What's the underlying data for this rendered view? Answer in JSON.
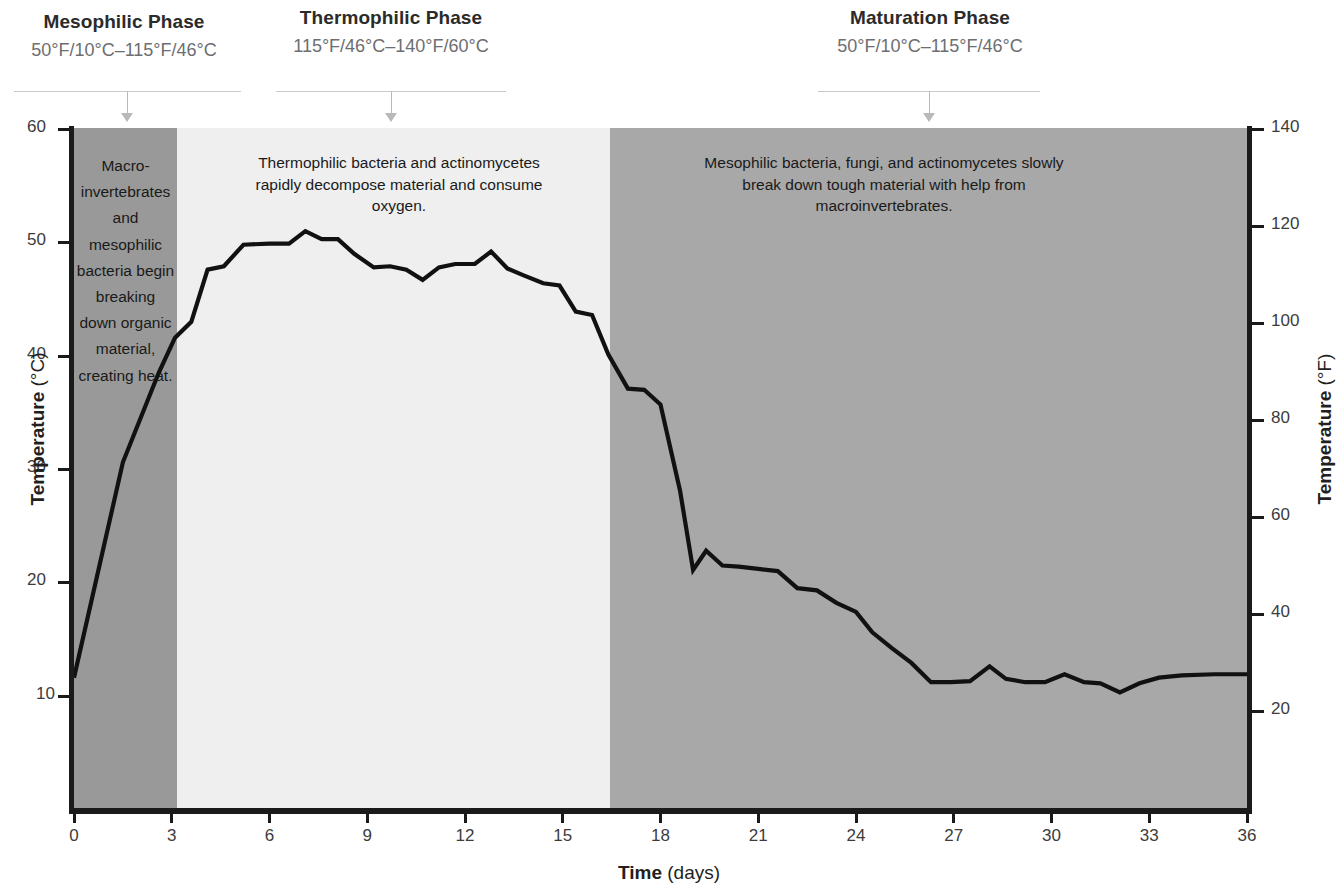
{
  "phases": [
    {
      "title": "Mesophilic Phase",
      "range": "50°F/10°C–115°F/46°C"
    },
    {
      "title": "Thermophilic Phase",
      "range": "115°F/46°C–140°F/60°C"
    },
    {
      "title": "Maturation Phase",
      "range": "50°F/10°C–115°F/46°C"
    }
  ],
  "annotations": [
    "Macro-invertebrates and mesophilic bacteria begin breaking down organic material, creating heat.",
    "Thermophilic bacteria and actinomycetes rapidly decompose material and consume oxygen.",
    "Mesophilic bacteria, fungi, and actinomycetes slowly break down tough material with help from macroinvertebrates."
  ],
  "axes": {
    "x_title": "Time",
    "x_unit": "(days)",
    "y_left_title": "Temperature",
    "y_left_unit": "(°C)",
    "y_right_title": "Temperature",
    "y_right_unit": "(°F)"
  },
  "colors": {
    "band_mesophilic": "#999999",
    "band_thermophilic": "#efefef",
    "band_maturation": "#a8a8a8",
    "line": "#111111",
    "axis": "#1a1a1a",
    "rule": "#c9c9c9"
  },
  "chart_data": {
    "type": "line",
    "title": "",
    "xlabel": "Time (days)",
    "ylabel": "Temperature (°C)",
    "y2label": "Temperature (°F)",
    "xlim": [
      0,
      36
    ],
    "ylim": [
      0,
      60
    ],
    "y2lim": [
      0,
      140
    ],
    "xticks": [
      0,
      3,
      6,
      9,
      12,
      15,
      18,
      21,
      24,
      27,
      30,
      33,
      36
    ],
    "yticks": [
      10,
      20,
      30,
      40,
      50,
      60
    ],
    "y2ticks": [
      20,
      40,
      60,
      80,
      100,
      120,
      140
    ],
    "grid": false,
    "legend": "none",
    "bands": [
      {
        "label": "Mesophilic Phase",
        "x0": 0.0,
        "x1": 3.05,
        "color": "#999999"
      },
      {
        "label": "Thermophilic Phase",
        "x0": 3.05,
        "x1": 16.1,
        "color": "#efefef"
      },
      {
        "label": "Maturation Phase",
        "x0": 16.1,
        "x1": 36.0,
        "color": "#a8a8a8"
      }
    ],
    "series": [
      {
        "name": "Compost pile temperature",
        "x": [
          0,
          1.5,
          2.6,
          3.1,
          3.6,
          4.1,
          4.6,
          5.2,
          6.0,
          6.6,
          7.1,
          7.6,
          8.1,
          8.6,
          9.2,
          9.7,
          10.2,
          10.7,
          11.2,
          11.7,
          12.3,
          12.8,
          13.3,
          13.8,
          14.4,
          14.9,
          15.4,
          15.9,
          16.4,
          17.0,
          17.5,
          18.0,
          18.6,
          19.0,
          19.4,
          19.9,
          20.4,
          21.0,
          21.6,
          22.2,
          22.8,
          23.4,
          24.0,
          24.5,
          25.1,
          25.7,
          26.3,
          26.9,
          27.5,
          28.1,
          28.6,
          29.2,
          29.8,
          30.4,
          31.0,
          31.5,
          32.1,
          32.7,
          33.3,
          34.0,
          35.0,
          36.0
        ],
        "y": [
          11.5,
          30.5,
          38.4,
          41.5,
          42.9,
          47.5,
          47.8,
          49.7,
          49.8,
          49.8,
          50.9,
          50.2,
          50.2,
          48.9,
          47.7,
          47.8,
          47.5,
          46.6,
          47.7,
          48.0,
          48.0,
          49.1,
          47.6,
          47.0,
          46.3,
          46.1,
          43.8,
          43.5,
          40.0,
          37.0,
          36.9,
          35.6,
          28.0,
          21.0,
          22.7,
          21.4,
          21.3,
          21.1,
          20.9,
          19.4,
          19.2,
          18.1,
          17.3,
          15.5,
          14.1,
          12.8,
          11.1,
          11.1,
          11.2,
          12.5,
          11.4,
          11.1,
          11.1,
          11.8,
          11.1,
          11.0,
          10.2,
          11.0,
          11.5,
          11.7,
          11.8,
          11.8
        ]
      }
    ]
  }
}
